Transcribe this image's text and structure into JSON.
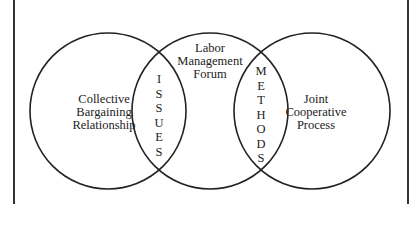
{
  "diagram": {
    "type": "venn",
    "circles": [
      {
        "id": "left",
        "label_lines": [
          "Collective",
          "Bargaining",
          "Relationship"
        ]
      },
      {
        "id": "middle",
        "label_lines": [
          "Labor",
          "Management",
          "Forum"
        ]
      },
      {
        "id": "right",
        "label_lines": [
          "Joint",
          "Cooperative",
          "Process"
        ]
      }
    ],
    "overlaps": [
      {
        "between": [
          "left",
          "middle"
        ],
        "label": "ISSUES",
        "letters": [
          "I",
          "S",
          "S",
          "U",
          "E",
          "S"
        ]
      },
      {
        "between": [
          "middle",
          "right"
        ],
        "label": "METHODS",
        "letters": [
          "M",
          "E",
          "T",
          "H",
          "O",
          "D",
          "S"
        ]
      }
    ],
    "colors": {
      "stroke": "#222222",
      "background": "#ffffff",
      "text": "#222222"
    }
  }
}
